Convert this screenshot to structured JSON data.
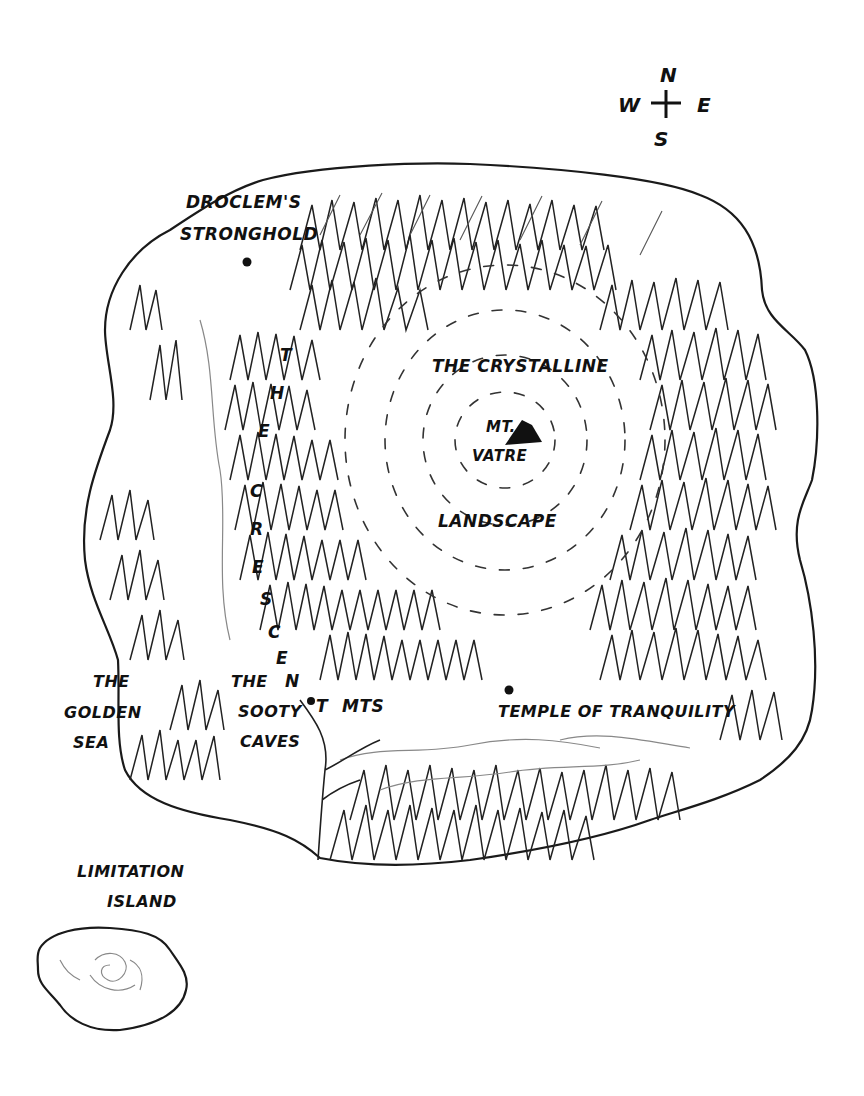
{
  "map": {
    "background_color": "#ffffff",
    "ink_color": "#111111",
    "compass": {
      "north": "N",
      "south": "S",
      "east": "E",
      "west": "W"
    },
    "regions": {
      "stronghold": {
        "line1": "DROCLEM'S",
        "line2": "STRONGHOLD"
      },
      "crystalline": {
        "line1": "THE CRYSTALLINE",
        "line2": "LANDSCAPE"
      },
      "mountain": {
        "line1": "MT.",
        "line2": "VATRE"
      },
      "crescent_mts": {
        "letters": [
          "T",
          "H",
          "E",
          "C",
          "R",
          "E",
          "S",
          "C",
          "E",
          "N",
          "T"
        ],
        "suffix": "MTS"
      },
      "sooty_caves": {
        "line1": "THE",
        "line2": "SOOTY",
        "line3": "CAVES"
      },
      "temple": {
        "label": "TEMPLE OF TRANQUILITY"
      },
      "golden_sea": {
        "line1": "THE",
        "line2": "GOLDEN",
        "line3": "SEA"
      },
      "limitation_island": {
        "line1": "LIMITATION",
        "line2": "ISLAND"
      }
    },
    "markers": [
      {
        "name": "stronghold-marker",
        "x": 247,
        "y": 262
      },
      {
        "name": "sooty-caves-marker",
        "x": 311,
        "y": 701
      },
      {
        "name": "temple-marker",
        "x": 509,
        "y": 690
      }
    ]
  }
}
